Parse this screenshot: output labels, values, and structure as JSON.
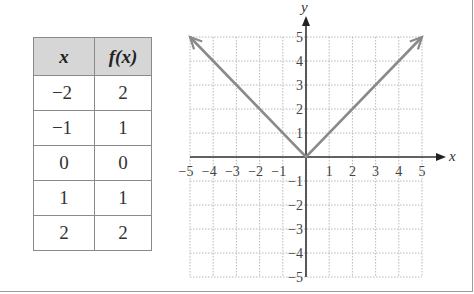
{
  "table": {
    "headers": [
      "x",
      "f(x)"
    ],
    "rows": [
      {
        "x": "−2",
        "fx": "2"
      },
      {
        "x": "−1",
        "fx": "1"
      },
      {
        "x": "0",
        "fx": "0"
      },
      {
        "x": "1",
        "fx": "1"
      },
      {
        "x": "2",
        "fx": "2"
      }
    ]
  },
  "chart_data": {
    "type": "line",
    "title": "",
    "xlabel": "x",
    "ylabel": "y",
    "xlim": [
      -5,
      5
    ],
    "ylim": [
      -5,
      5
    ],
    "grid": true,
    "x_ticks": [
      "−5",
      "−4",
      "−3",
      "−2",
      "−1",
      "1",
      "2",
      "3",
      "4",
      "5"
    ],
    "y_ticks": [
      "5",
      "4",
      "3",
      "2",
      "1",
      "−1",
      "−2",
      "−3",
      "−4",
      "−5"
    ],
    "series": [
      {
        "name": "f(x) = |x|",
        "x": [
          -5,
          0,
          5
        ],
        "y": [
          5,
          0,
          5
        ],
        "color": "#8a8a8a",
        "arrows_at_ends": true
      }
    ],
    "table_points": [
      {
        "x": -2,
        "y": 2
      },
      {
        "x": -1,
        "y": 1
      },
      {
        "x": 0,
        "y": 0
      },
      {
        "x": 1,
        "y": 1
      },
      {
        "x": 2,
        "y": 2
      }
    ]
  }
}
